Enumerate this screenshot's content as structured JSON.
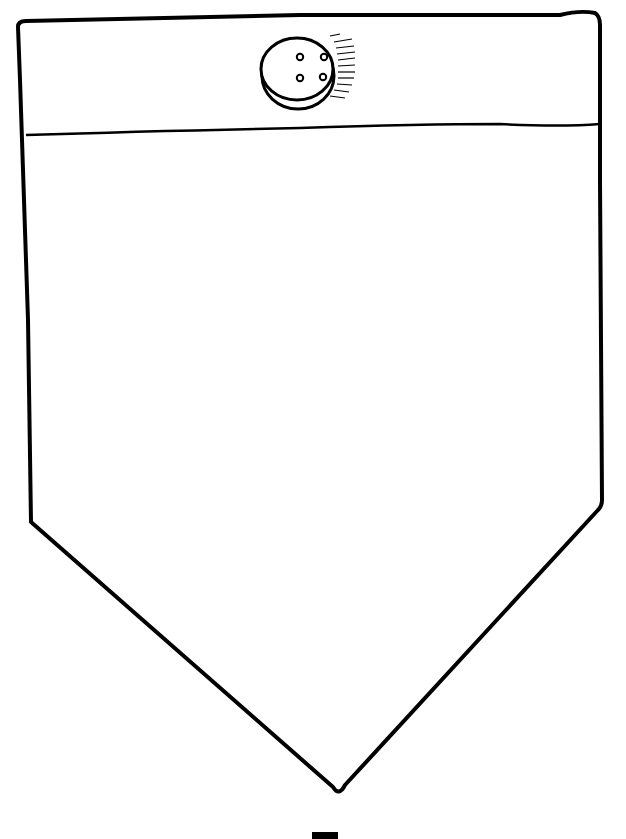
{
  "drawing": {
    "subject": "pocket with button",
    "stroke_color": "#000000",
    "background_color": "#ffffff",
    "fill_color": "#ffffff"
  }
}
